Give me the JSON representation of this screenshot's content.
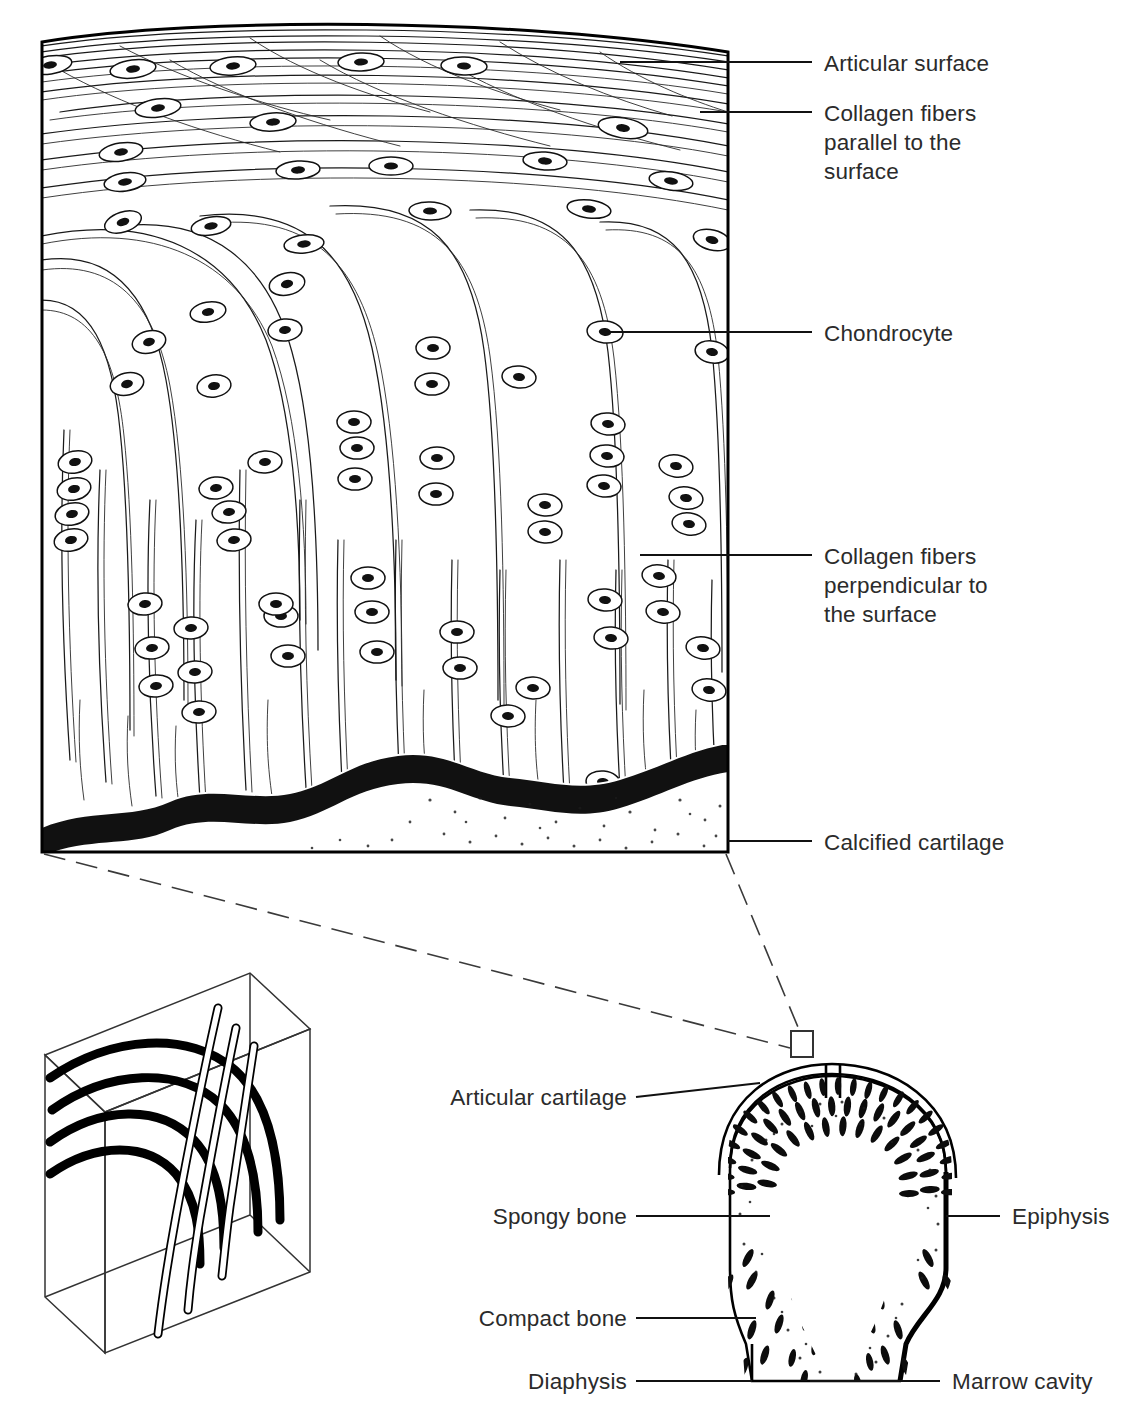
{
  "figure": {
    "background_color": "#ffffff",
    "ink_color": "#111111",
    "label_color": "#2b2b2b"
  },
  "main_panel": {
    "name": "articular-cartilage-block",
    "description": "Cut block of articular cartilage showing collagen fiber arcades, chondrocytes in lacunae, and the calcified cartilage layer at the base.",
    "labels": [
      {
        "id": "articular-surface",
        "text": "Articular surface",
        "text_x": 824,
        "text_y": 75,
        "leader": [
          [
            620,
            62
          ],
          [
            812,
            62
          ]
        ],
        "align": "left"
      },
      {
        "id": "collagen-parallel",
        "text_lines": [
          "Collagen fibers",
          "parallel to the",
          "surface"
        ],
        "text_x": 824,
        "text_y": 122,
        "leader": [
          [
            700,
            112
          ],
          [
            812,
            112
          ]
        ],
        "align": "left"
      },
      {
        "id": "chondrocyte",
        "text": "Chondrocyte",
        "text_x": 824,
        "text_y": 341,
        "leader": [
          [
            608,
            332
          ],
          [
            812,
            332
          ]
        ],
        "align": "left"
      },
      {
        "id": "collagen-perpendicular",
        "text_lines": [
          "Collagen fibers",
          "perpendicular to",
          "the surface"
        ],
        "text_x": 824,
        "text_y": 564,
        "leader": [
          [
            640,
            555
          ],
          [
            812,
            555
          ]
        ],
        "align": "left"
      },
      {
        "id": "calcified-cartilage",
        "text": "Calcified cartilage",
        "text_x": 824,
        "text_y": 849,
        "leader": [
          [
            728,
            841
          ],
          [
            812,
            841
          ]
        ],
        "align": "left"
      }
    ],
    "zones": [
      {
        "id": "superficial-zone",
        "label": "Collagen fibers parallel to the surface"
      },
      {
        "id": "transitional-zone",
        "label": "Arcading collagen fibers"
      },
      {
        "id": "radial-zone",
        "label": "Collagen fibers perpendicular to the surface"
      },
      {
        "id": "calcified-zone",
        "label": "Calcified cartilage"
      }
    ]
  },
  "inset_box": {
    "name": "collagen-arcade-3d-box",
    "description": "Isometric wireframe box showing thick horizontal arcing collagen fibers and hollow vertical fibers in three dimensions."
  },
  "callout": {
    "name": "magnification-callout",
    "description": "Dashed leader lines from the corners of the cartilage block to a small rectangle marking the sampled region on the bone's articular surface."
  },
  "bone_panel": {
    "name": "long-bone-epiphysis-section",
    "description": "Longitudinal section through the epiphysis of a long bone showing articular cartilage, spongy bone, compact bone and marrow cavity.",
    "labels": [
      {
        "id": "articular-cartilage",
        "text": "Articular cartilage",
        "text_x": 627,
        "text_y": 1105,
        "leader": [
          [
            636,
            1097
          ],
          [
            718,
            1097
          ]
        ],
        "align": "right"
      },
      {
        "id": "spongy-bone",
        "text": "Spongy bone",
        "text_x": 627,
        "text_y": 1224,
        "leader": [
          [
            636,
            1216
          ],
          [
            718,
            1216
          ]
        ],
        "align": "right"
      },
      {
        "id": "compact-bone",
        "text": "Compact bone",
        "text_x": 627,
        "text_y": 1325,
        "leader": [
          [
            636,
            1318
          ],
          [
            724,
            1318
          ]
        ],
        "align": "right"
      },
      {
        "id": "diaphysis",
        "text": "Diaphysis",
        "text_x": 627,
        "text_y": 1388,
        "leader": [
          [
            636,
            1381
          ],
          [
            724,
            1381
          ]
        ],
        "align": "right"
      },
      {
        "id": "epiphysis",
        "text": "Epiphysis",
        "text_x": 1012,
        "text_y": 1224,
        "leader": [
          [
            952,
            1216
          ],
          [
            1000,
            1216
          ]
        ],
        "align": "left"
      },
      {
        "id": "marrow-cavity",
        "text": "Marrow cavity",
        "text_x": 952,
        "text_y": 1388,
        "leader": [
          [
            810,
            1381
          ],
          [
            940,
            1381
          ]
        ],
        "align": "left"
      }
    ]
  }
}
